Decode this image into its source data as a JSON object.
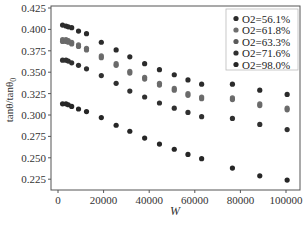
{
  "chart_data": {
    "type": "scatter",
    "title": "",
    "xlabel": "W",
    "ylabel": "tanθ/tanθ0",
    "ylabel_parts": {
      "main": "tanθ/tanθ",
      "sub": "0"
    },
    "xlim": [
      -3000,
      106000
    ],
    "ylim": [
      0.211,
      0.427
    ],
    "x_ticks": [
      0,
      20000,
      40000,
      60000,
      80000,
      100000
    ],
    "x_tick_labels": [
      "0",
      "20000",
      "40000",
      "60000",
      "80000",
      "100000"
    ],
    "y_ticks": [
      0.225,
      0.25,
      0.275,
      0.3,
      0.325,
      0.35,
      0.375,
      0.4,
      0.425
    ],
    "y_tick_labels": [
      "0.225",
      "0.250",
      "0.275",
      "0.300",
      "0.325",
      "0.350",
      "0.375",
      "0.400",
      "0.425"
    ],
    "grid": false,
    "legend_position": "upper right",
    "x": [
      2000,
      3500,
      4500,
      6000,
      9000,
      12500,
      19000,
      25500,
      31500,
      38000,
      44500,
      51000,
      57000,
      63000,
      76500,
      88500,
      100500
    ],
    "series": [
      {
        "name": "O2=56.1%",
        "color": "#2b2b2b",
        "values": [
          0.405,
          0.404,
          0.403,
          0.402,
          0.398,
          0.395,
          0.385,
          0.376,
          0.368,
          0.36,
          0.353,
          0.347,
          0.341,
          0.336,
          0.336,
          0.329,
          0.324
        ]
      },
      {
        "name": "O2=61.8%",
        "color": "#6e6e6e",
        "values": [
          0.388,
          0.388,
          0.387,
          0.385,
          0.382,
          0.378,
          0.369,
          0.36,
          0.351,
          0.344,
          0.337,
          0.331,
          0.325,
          0.321,
          0.32,
          0.313,
          0.308
        ]
      },
      {
        "name": "O2=63.3%",
        "color": "#6a6a6a",
        "values": [
          0.386,
          0.386,
          0.385,
          0.383,
          0.38,
          0.376,
          0.367,
          0.358,
          0.349,
          0.342,
          0.335,
          0.329,
          0.323,
          0.319,
          0.318,
          0.311,
          0.306
        ]
      },
      {
        "name": "O2=71.6%",
        "color": "#303030",
        "values": [
          0.364,
          0.364,
          0.363,
          0.361,
          0.358,
          0.354,
          0.346,
          0.337,
          0.328,
          0.321,
          0.314,
          0.308,
          0.303,
          0.298,
          0.296,
          0.289,
          0.283
        ]
      },
      {
        "name": "O2=98.0%",
        "color": "#262626",
        "values": [
          0.313,
          0.313,
          0.312,
          0.31,
          0.307,
          0.304,
          0.297,
          0.288,
          0.281,
          0.273,
          0.266,
          0.26,
          0.254,
          0.249,
          0.238,
          0.229,
          0.224
        ]
      }
    ]
  },
  "legend": {
    "items": [
      {
        "label": "O2=56.1%",
        "color": "#2b2b2b"
      },
      {
        "label": "O2=61.8%",
        "color": "#6e6e6e"
      },
      {
        "label": "O2=63.3%",
        "color": "#5a5a5a"
      },
      {
        "label": "O2=71.6%",
        "color": "#303030"
      },
      {
        "label": "O2=98.0%",
        "color": "#262626"
      }
    ]
  }
}
